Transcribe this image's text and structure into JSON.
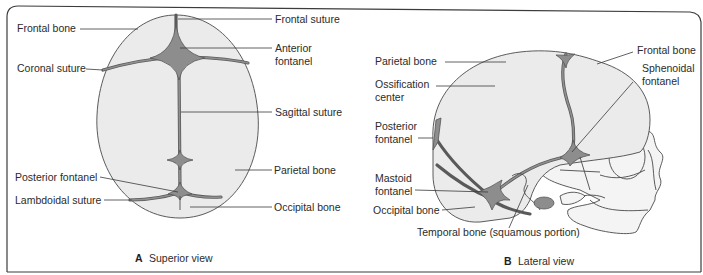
{
  "figure": {
    "panels": [
      {
        "id": "A",
        "caption_letter": "A",
        "caption_text": "Superior view",
        "labels_left": [
          "Frontal bone",
          "Coronal suture",
          "Posterior fontanel",
          "Lambdoidal suture"
        ],
        "labels_right": [
          "Frontal suture",
          "Anterior",
          "fontanel",
          "Sagittal suture",
          "Parietal bone",
          "Occipital bone"
        ]
      },
      {
        "id": "B",
        "caption_letter": "B",
        "caption_text": "Lateral view",
        "labels_left": [
          "Parietal bone",
          "Ossification",
          "center",
          "Posterior",
          "fontanel",
          "Mastoid",
          "fontanel",
          "Occipital bone"
        ],
        "labels_right": [
          "Frontal bone",
          "Sphenoidal",
          "fontanel"
        ],
        "label_bottom": "Temporal bone (squamous portion)"
      }
    ],
    "colors": {
      "bone_fill": "#ebebeb",
      "fontanel_fill": "#8d8d8d",
      "suture_stroke": "#5a5a5a",
      "outline": "#4a4a4a",
      "text": "#2b2b2b"
    }
  }
}
